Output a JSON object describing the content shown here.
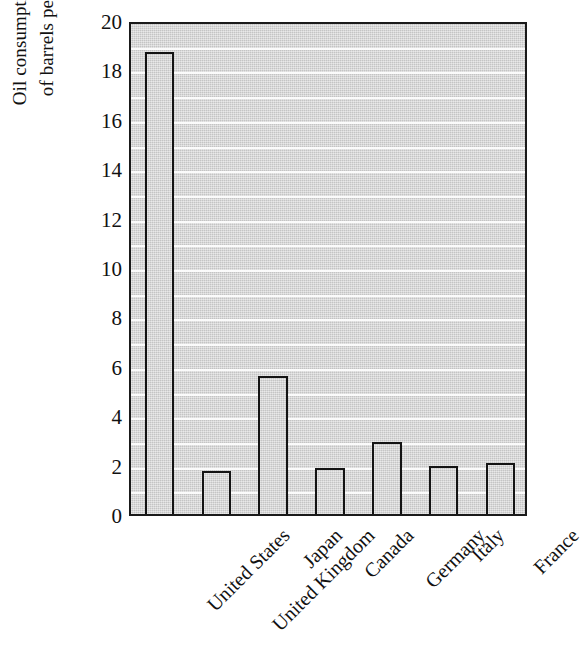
{
  "chart_data": {
    "type": "bar",
    "title": "",
    "subtitle": "",
    "xlabel": "",
    "ylabel": "Oil consumption in millions of barrels per day in 2000",
    "ylabel_lines": [
      "Oil consumption in millions",
      "of barrels per day in 2000"
    ],
    "categories": [
      "United States",
      "United Kingdom",
      "Japan",
      "Canada",
      "Germany",
      "Italy",
      "France"
    ],
    "values": [
      18.7,
      1.75,
      5.6,
      1.85,
      2.9,
      1.95,
      2.05
    ],
    "series": [
      {
        "name": "Oil consumption",
        "values": [
          18.7,
          1.75,
          5.6,
          1.85,
          2.9,
          1.95,
          2.05
        ]
      }
    ],
    "ylim": [
      0,
      20
    ],
    "ytick_labels": [
      "0",
      "2",
      "4",
      "6",
      "8",
      "10",
      "12",
      "14",
      "16",
      "18",
      "20"
    ],
    "ytick_values": [
      0,
      2,
      4,
      6,
      8,
      10,
      12,
      14,
      16,
      18,
      20
    ],
    "ytick_step": 2,
    "gridline_values": [
      1,
      2,
      3,
      4,
      5,
      6,
      7,
      8,
      9,
      10,
      11,
      12,
      13,
      14,
      15,
      16,
      17,
      18,
      19
    ],
    "grid": true,
    "grid_axis": "y",
    "grid_color": "#fbfbfb",
    "legend": null,
    "legend_position": "none",
    "annotations": [],
    "xtick_rotation_degrees": 45,
    "colors": {
      "plot_background": "#d2d2d2",
      "bar_fill": "#d2d2d2",
      "bar_edge": "#141414",
      "axis": "#1a1a1a",
      "text": "#111111",
      "page_background": "#ffffff"
    }
  }
}
